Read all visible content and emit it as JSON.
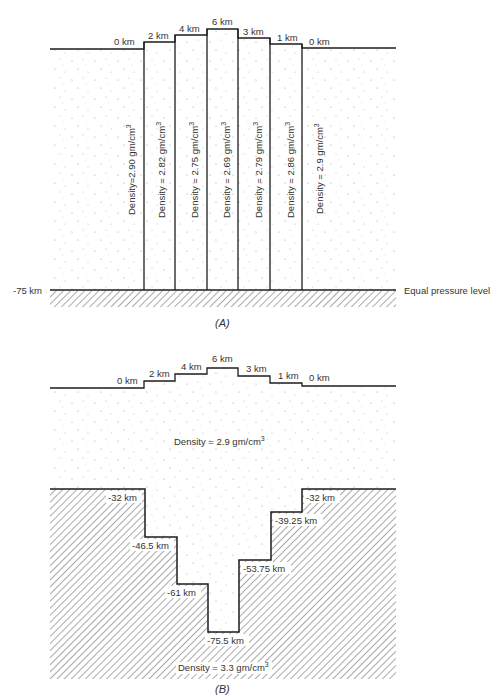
{
  "panel_a": {
    "caption": "(A)",
    "surface_labels": [
      "0 km",
      "2 km",
      "4 km",
      "6 km",
      "3 km",
      "1 km",
      "0 km"
    ],
    "column_densities": [
      "Density=2.90 gm/cm",
      "Density = 2.82 gm/cm",
      "Density = 2.75 gm/cm",
      "Density = 2.69 gm/cm",
      "Density = 2.79 gm/cm",
      "Density = 2.86 gm/cm",
      "Density = 2.9 gm/cm"
    ],
    "superscript": "3",
    "depth_label": "-75 km",
    "base_label": "Equal pressure level"
  },
  "panel_b": {
    "caption": "(B)",
    "surface_labels": [
      "0 km",
      "2 km",
      "4 km",
      "6 km",
      "3 km",
      "1 km",
      "0 km"
    ],
    "crust_density": "Density = 2.9 gm/cm",
    "mantle_density": "Density = 3.3 gm/cm",
    "superscript": "3",
    "root_depths": [
      "-32 km",
      "-46.5 km",
      "-61 km",
      "-75.5 km",
      "-53.75 km",
      "-39.25 km",
      "-32 km"
    ]
  },
  "colors": {
    "line": "#1c1c1c",
    "text": "#333333",
    "hatch": "#555555",
    "stipple": "#9a9a9a",
    "background": "#ffffff"
  }
}
